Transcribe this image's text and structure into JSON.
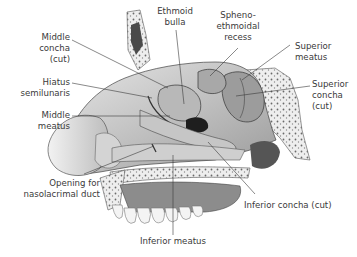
{
  "figure": {
    "labels": {
      "middle_concha_cut": [
        "Middle",
        "concha",
        "(cut)"
      ],
      "ethmoid_bulla": [
        "Ethmoid",
        "bulla"
      ],
      "spheno_ethmoidal_recess": [
        "Spheno-",
        "ethmoidal",
        "recess"
      ],
      "superior_meatus": [
        "Superior",
        "meatus"
      ],
      "hiatus_semilunaris": [
        "Hiatus",
        "semilunaris"
      ],
      "superior_concha_cut": [
        "Superior",
        "concha",
        "(cut)"
      ],
      "middle_meatus": [
        "Middle",
        "meatus"
      ],
      "opening_nasolacrimal_duct": [
        "Opening for",
        "nasolacrimal duct"
      ],
      "inferior_concha_cut": [
        "Inferior concha (cut)"
      ],
      "inferior_meatus": [
        "Inferior meatus"
      ]
    }
  }
}
